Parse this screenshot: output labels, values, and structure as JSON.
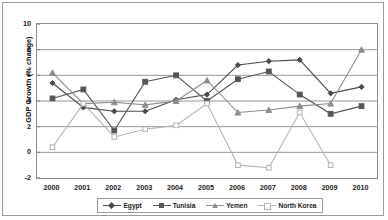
{
  "chart_data": {
    "type": "line",
    "title": "",
    "xlabel": "",
    "ylabel": "GDP Growth (% change)",
    "categories": [
      "2000",
      "2001",
      "2002",
      "2003",
      "2004",
      "2005",
      "2006",
      "2007",
      "2008",
      "2009",
      "2010"
    ],
    "ylim": [
      -2,
      10
    ],
    "yticks": [
      -2,
      0,
      2,
      4,
      6,
      8,
      10
    ],
    "grid": true,
    "legend_position": "bottom",
    "series": [
      {
        "name": "Egypt",
        "color": "#4a4a4a",
        "marker": "diamond",
        "values": [
          5.4,
          3.5,
          3.2,
          3.2,
          4.1,
          4.5,
          6.8,
          7.1,
          7.2,
          4.6,
          5.1
        ]
      },
      {
        "name": "Tunisia",
        "color": "#565656",
        "marker": "square",
        "values": [
          4.2,
          4.9,
          1.7,
          5.5,
          6.0,
          4.0,
          5.7,
          6.3,
          4.5,
          3.0,
          3.6
        ]
      },
      {
        "name": "Yemen",
        "color": "#8e8e8e",
        "marker": "triangle",
        "values": [
          6.2,
          3.8,
          3.9,
          3.7,
          4.0,
          5.6,
          3.1,
          3.3,
          3.6,
          3.8,
          8.0
        ]
      },
      {
        "name": "North Korea",
        "color": "#b4b4b4",
        "marker": "open-square",
        "values": [
          0.4,
          3.8,
          1.2,
          1.8,
          2.1,
          3.8,
          -1.0,
          -1.2,
          3.1,
          -1.0,
          null
        ]
      }
    ]
  },
  "axis": {
    "y_title": "GDP Growth (% change)",
    "y_labels": [
      "10",
      "8",
      "6",
      "4",
      "2",
      "0",
      "-2"
    ],
    "x_labels": [
      "2000",
      "2001",
      "2002",
      "2003",
      "2004",
      "2005",
      "2006",
      "2007",
      "2008",
      "2009",
      "2010"
    ]
  },
  "legend": {
    "items": [
      {
        "label": "Egypt"
      },
      {
        "label": "Tunisia"
      },
      {
        "label": "Yemen"
      },
      {
        "label": "North Korea"
      }
    ]
  }
}
